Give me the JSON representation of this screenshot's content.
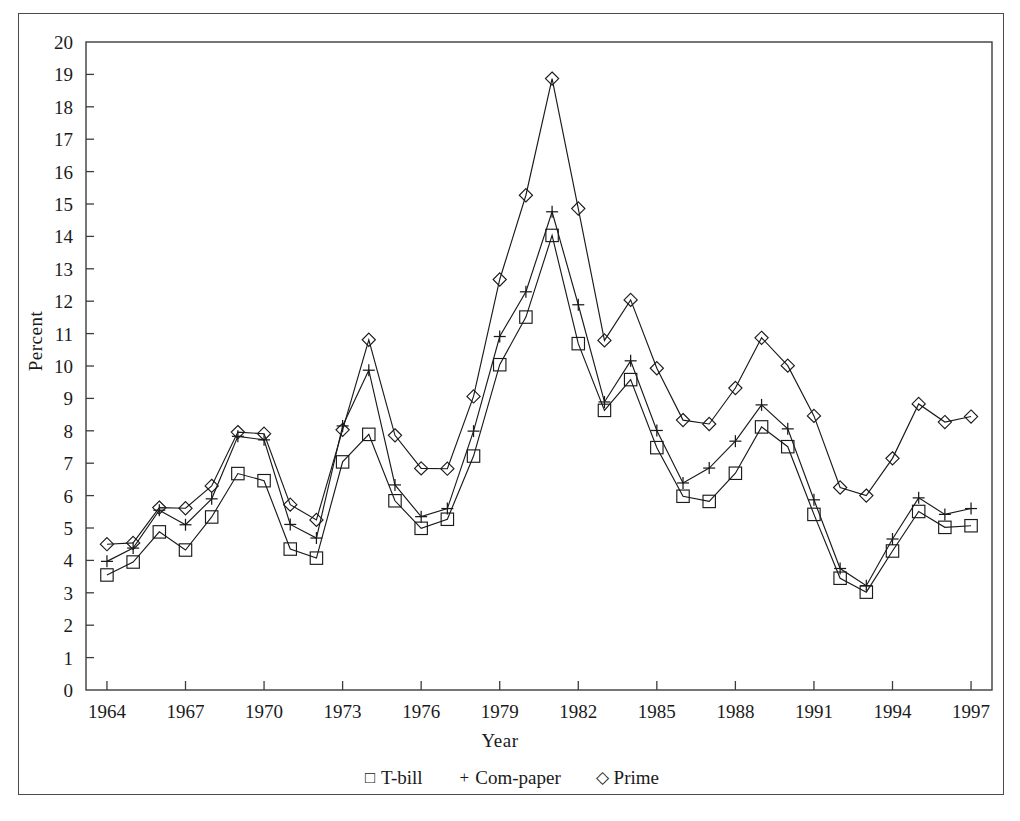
{
  "chart_data": {
    "type": "line",
    "title": "",
    "subtitle": "",
    "xlabel": "Year",
    "ylabel": "Percent",
    "xlim": [
      1963.2,
      1997.8
    ],
    "ylim": [
      0,
      20
    ],
    "grid": false,
    "legend_position": "bottom-center",
    "x_tick_step": 3,
    "y_tick_step": 1,
    "xticks": [
      1964,
      1967,
      1970,
      1973,
      1976,
      1979,
      1982,
      1985,
      1988,
      1991,
      1994,
      1997
    ],
    "yticks": [
      0,
      1,
      2,
      3,
      4,
      5,
      6,
      7,
      8,
      9,
      10,
      11,
      12,
      13,
      14,
      15,
      16,
      17,
      18,
      19,
      20
    ],
    "x": [
      1964,
      1965,
      1966,
      1967,
      1968,
      1969,
      1970,
      1971,
      1972,
      1973,
      1974,
      1975,
      1976,
      1977,
      1978,
      1979,
      1980,
      1981,
      1982,
      1983,
      1984,
      1985,
      1986,
      1987,
      1988,
      1989,
      1990,
      1991,
      1992,
      1993,
      1994,
      1995,
      1996,
      1997
    ],
    "series": [
      {
        "name": "T-bill",
        "marker": "square",
        "glyph": "□",
        "color": "#1a1a1a",
        "values": [
          3.55,
          3.95,
          4.88,
          4.32,
          5.34,
          6.68,
          6.46,
          4.35,
          4.07,
          7.04,
          7.89,
          5.84,
          4.99,
          5.27,
          7.22,
          10.04,
          11.51,
          14.03,
          10.69,
          8.63,
          9.58,
          7.48,
          5.98,
          5.82,
          6.69,
          8.12,
          7.51,
          5.42,
          3.45,
          3.02,
          4.29,
          5.51,
          5.02,
          5.07
        ]
      },
      {
        "name": "Com-paper",
        "marker": "plus",
        "glyph": "+",
        "color": "#1a1a1a",
        "values": [
          3.97,
          4.38,
          5.55,
          5.1,
          5.9,
          7.83,
          7.72,
          5.11,
          4.69,
          8.15,
          9.87,
          6.33,
          5.35,
          5.6,
          7.99,
          10.91,
          12.29,
          14.76,
          11.89,
          8.89,
          10.16,
          8.01,
          6.39,
          6.85,
          7.68,
          8.8,
          8.06,
          5.87,
          3.75,
          3.22,
          4.66,
          5.93,
          5.42,
          5.6
        ]
      },
      {
        "name": "Prime",
        "marker": "diamond",
        "glyph": "◇",
        "color": "#1a1a1a",
        "values": [
          4.5,
          4.54,
          5.63,
          5.61,
          6.3,
          7.96,
          7.91,
          5.72,
          5.25,
          8.03,
          10.81,
          7.86,
          6.84,
          6.83,
          9.06,
          12.67,
          15.27,
          18.87,
          14.86,
          10.79,
          12.04,
          9.93,
          8.33,
          8.21,
          9.32,
          10.87,
          10.01,
          8.46,
          6.25,
          6.0,
          7.15,
          8.83,
          8.27,
          8.44
        ]
      }
    ]
  },
  "axes": {
    "ylabel": "Percent",
    "xlabel": "Year"
  },
  "legend": {
    "entries": [
      {
        "glyph": "□",
        "label": "T-bill"
      },
      {
        "glyph": "+",
        "label": "Com-paper"
      },
      {
        "glyph": "◇",
        "label": "Prime"
      }
    ]
  }
}
